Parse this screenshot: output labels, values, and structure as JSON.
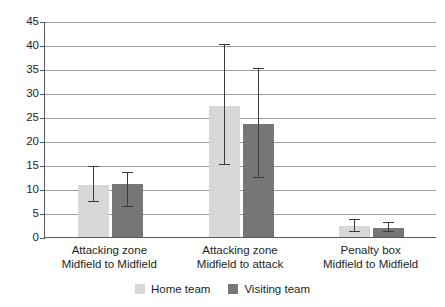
{
  "chart_data": {
    "type": "bar",
    "title": "",
    "subtitle": "",
    "xlabel": "",
    "ylabel": "",
    "ylim": [
      0,
      45
    ],
    "ytick_step": 5,
    "yticks": [
      "0",
      "5",
      "10",
      "15",
      "20",
      "25",
      "30",
      "35",
      "40",
      "45"
    ],
    "grid": "horizontal",
    "legend_position": "bottom-center",
    "error_bars": true,
    "categories": [
      "Attacking zone Midfield to Midfield",
      "Attacking zone Midfield to attack",
      "Penalty box Midfield to Midfield"
    ],
    "category_lines": [
      {
        "line1": "Attacking zone",
        "line2": "Midfield to Midfield"
      },
      {
        "line1": "Attacking zone",
        "line2": "Midfield to attack"
      },
      {
        "line1": "Penalty box",
        "line2": "Midfield to Midfield"
      }
    ],
    "series": [
      {
        "name": "Home team",
        "color": "#d8d8d8",
        "values": [
          10.8,
          27.3,
          2.2
        ],
        "err_low": [
          7.2,
          15.0,
          1.0
        ],
        "err_high": [
          14.5,
          40.0,
          3.5
        ]
      },
      {
        "name": "Visiting team",
        "color": "#767676",
        "values": [
          11.0,
          23.5,
          1.8
        ],
        "err_low": [
          6.3,
          12.3,
          1.0
        ],
        "err_high": [
          13.3,
          35.0,
          3.0
        ]
      }
    ]
  },
  "legend": {
    "items": [
      {
        "label": "Home team",
        "color": "#d8d8d8"
      },
      {
        "label": "Visiting team",
        "color": "#767676"
      }
    ]
  },
  "axis": {
    "line_color": "#58595b",
    "grid_color": "#9a9c9f"
  }
}
